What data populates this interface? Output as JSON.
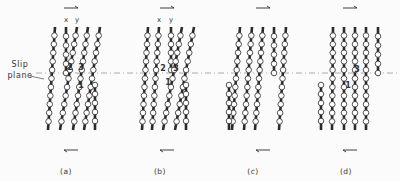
{
  "figure": {
    "slip_plane_label_line1": "Slip",
    "slip_plane_label_line2": "plane",
    "slip_plane_y": 73,
    "colors": {
      "ink": "#2a2a2a",
      "atom_fill": "#ffffff",
      "dash": "#9a9a9a"
    },
    "panels": [
      {
        "id": "a",
        "label": "(a)",
        "label_x": 66,
        "arrow_x": 71,
        "xy_labels": [
          {
            "text": "x",
            "x": 66
          },
          {
            "text": "y",
            "x": 77
          }
        ],
        "numbers": [
          {
            "text": "2",
            "x": 70,
            "y": 70
          },
          {
            "text": "3",
            "x": 81,
            "y": 70
          },
          {
            "text": "1",
            "x": 81,
            "y": 88
          }
        ],
        "chains": [
          {
            "x1": 55,
            "y1": 27,
            "x2": 48,
            "y2": 130,
            "top": true
          },
          {
            "x1": 66,
            "y1": 27,
            "x2": 66,
            "y2": 73,
            "end_atom": true
          },
          {
            "x1": 77,
            "y1": 27,
            "x2": 60,
            "y2": 130
          },
          {
            "x1": 88,
            "y1": 27,
            "x2": 73,
            "y2": 130
          },
          {
            "x1": 100,
            "y1": 27,
            "x2": 84,
            "y2": 130
          },
          {
            "x1": 95,
            "y1": 85,
            "x2": 95,
            "y2": 130,
            "stub": true
          }
        ]
      },
      {
        "id": "b",
        "label": "(b)",
        "label_x": 160,
        "arrow_x": 167,
        "xy_labels": [
          {
            "text": "x",
            "x": 159
          },
          {
            "text": "y",
            "x": 171
          }
        ],
        "numbers": [
          {
            "text": "2",
            "x": 163,
            "y": 71
          },
          {
            "text": "3",
            "x": 176,
            "y": 71
          },
          {
            "text": "1",
            "x": 168,
            "y": 85
          }
        ],
        "chains": [
          {
            "x1": 148,
            "y1": 27,
            "x2": 142,
            "y2": 130
          },
          {
            "x1": 159,
            "y1": 27,
            "x2": 152,
            "y2": 130
          },
          {
            "x1": 171,
            "y1": 27,
            "x2": 171,
            "y2": 70,
            "end_atom": true
          },
          {
            "x1": 182,
            "y1": 27,
            "x2": 163,
            "y2": 130
          },
          {
            "x1": 194,
            "y1": 27,
            "x2": 175,
            "y2": 130
          },
          {
            "x1": 186,
            "y1": 85,
            "x2": 186,
            "y2": 130,
            "stub": true
          }
        ]
      },
      {
        "id": "c",
        "label": "(c)",
        "label_x": 253,
        "arrow_x": 263,
        "xy_labels": [],
        "numbers": [],
        "chains": [
          {
            "x1": 240,
            "y1": 27,
            "x2": 232,
            "y2": 130
          },
          {
            "x1": 252,
            "y1": 27,
            "x2": 244,
            "y2": 130
          },
          {
            "x1": 263,
            "y1": 27,
            "x2": 255,
            "y2": 130
          },
          {
            "x1": 274,
            "y1": 27,
            "x2": 274,
            "y2": 73,
            "end_atom": true
          },
          {
            "x1": 286,
            "y1": 27,
            "x2": 279,
            "y2": 130
          },
          {
            "x1": 229,
            "y1": 85,
            "x2": 229,
            "y2": 130,
            "stub": true
          }
        ]
      },
      {
        "id": "d",
        "label": "(d)",
        "label_x": 346,
        "arrow_x": 350,
        "xy_labels": [],
        "numbers": [
          {
            "text": "3",
            "x": 357,
            "y": 72
          },
          {
            "text": "1",
            "x": 348,
            "y": 88
          }
        ],
        "chains": [
          {
            "x1": 333,
            "y1": 27,
            "x2": 332,
            "y2": 130
          },
          {
            "x1": 344,
            "y1": 27,
            "x2": 344,
            "y2": 130
          },
          {
            "x1": 355,
            "y1": 27,
            "x2": 355,
            "y2": 130
          },
          {
            "x1": 366,
            "y1": 27,
            "x2": 366,
            "y2": 130
          },
          {
            "x1": 378,
            "y1": 27,
            "x2": 378,
            "y2": 73,
            "end_atom": true
          },
          {
            "x1": 321,
            "y1": 85,
            "x2": 321,
            "y2": 130,
            "stub": true
          }
        ]
      }
    ]
  }
}
